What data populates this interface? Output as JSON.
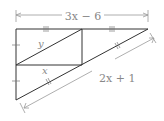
{
  "diagram": {
    "top_dimension_label": "3x − 6",
    "hypotenuse_dimension_label": "2x + 1",
    "segment_labels": {
      "diagonal": "y",
      "midsegment": "x"
    },
    "tick_marks": {
      "top_left": "|||",
      "top_right": "|||",
      "left_upper": "|",
      "left_lower": "|",
      "hypotenuse_upper": "||",
      "hypotenuse_lower": "||"
    },
    "colors": {
      "figure": "#333333",
      "dimension": "#999999",
      "label": "#888888"
    }
  }
}
